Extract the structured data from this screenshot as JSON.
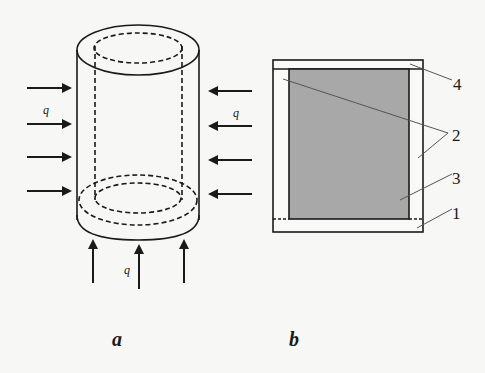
{
  "figure": {
    "colors": {
      "background": "#f7f7f5",
      "stroke": "#1a1a1a",
      "fill_gray": "#a8a8a8",
      "leader": "#444444"
    },
    "panel_a": {
      "label": "a",
      "load_symbol_left": "q",
      "load_symbol_right": "q",
      "load_symbol_bottom": "q",
      "left_arrow_count": 4,
      "right_arrow_count": 4,
      "bottom_arrow_count": 3
    },
    "panel_b": {
      "label": "b",
      "callouts": [
        {
          "id": "1",
          "text": "1"
        },
        {
          "id": "2",
          "text": "2"
        },
        {
          "id": "3",
          "text": "3"
        },
        {
          "id": "4",
          "text": "4"
        }
      ]
    }
  }
}
